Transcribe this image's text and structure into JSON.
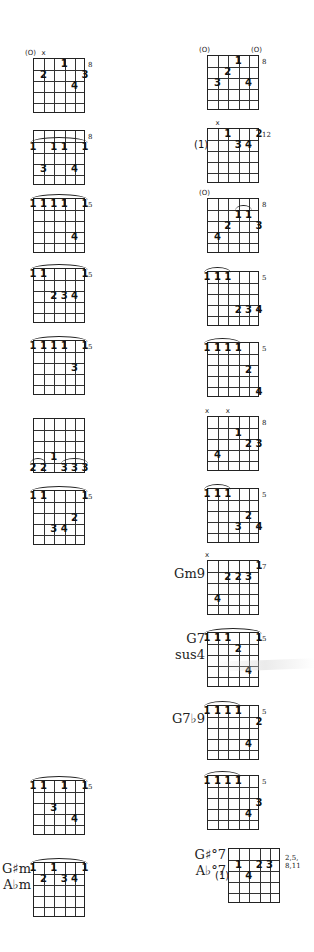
{
  "page": {
    "string_count": 6,
    "frets_shown": 5
  },
  "left_column": [
    {
      "id": "L1",
      "name": "",
      "top": 58,
      "left": 33,
      "fret": "8",
      "open_mute": [
        {
          "string": 0,
          "mark": "(O)"
        },
        {
          "string": 1,
          "mark": "x"
        }
      ],
      "fingers": [
        {
          "s": 3,
          "f": 0,
          "n": "1"
        },
        {
          "s": 1,
          "f": 1,
          "n": "2"
        },
        {
          "s": 5,
          "f": 1,
          "n": "3"
        },
        {
          "s": 4,
          "f": 2,
          "n": "4"
        }
      ],
      "barres": []
    },
    {
      "id": "L2",
      "name": "",
      "top": 130,
      "left": 33,
      "fret": "8",
      "open_mute": [],
      "fingers": [
        {
          "s": 0,
          "f": 1,
          "n": "1"
        },
        {
          "s": 2,
          "f": 1,
          "n": "1"
        },
        {
          "s": 3,
          "f": 1,
          "n": "1"
        },
        {
          "s": 5,
          "f": 1,
          "n": "1"
        },
        {
          "s": 1,
          "f": 3,
          "n": "3"
        },
        {
          "s": 4,
          "f": 3,
          "n": "4"
        }
      ],
      "barres": [
        {
          "from": 0,
          "to": 5,
          "f": 1
        }
      ]
    },
    {
      "id": "L3",
      "name": "",
      "top": 198,
      "left": 33,
      "fret": "5",
      "open_mute": [],
      "fingers": [
        {
          "s": 0,
          "f": 0,
          "n": "1"
        },
        {
          "s": 1,
          "f": 0,
          "n": "1"
        },
        {
          "s": 2,
          "f": 0,
          "n": "1"
        },
        {
          "s": 3,
          "f": 0,
          "n": "1"
        },
        {
          "s": 5,
          "f": 0,
          "n": "1"
        },
        {
          "s": 4,
          "f": 3,
          "n": "4"
        }
      ],
      "barres": [
        {
          "from": 0,
          "to": 5,
          "f": 0
        }
      ]
    },
    {
      "id": "L4",
      "name": "",
      "top": 268,
      "left": 33,
      "fret": "5",
      "open_mute": [],
      "fingers": [
        {
          "s": 0,
          "f": 0,
          "n": "1"
        },
        {
          "s": 1,
          "f": 0,
          "n": "1"
        },
        {
          "s": 5,
          "f": 0,
          "n": "1"
        },
        {
          "s": 2,
          "f": 2,
          "n": "2"
        },
        {
          "s": 3,
          "f": 2,
          "n": "3"
        },
        {
          "s": 4,
          "f": 2,
          "n": "4"
        }
      ],
      "barres": [
        {
          "from": 0,
          "to": 5,
          "f": 0
        }
      ]
    },
    {
      "id": "L5",
      "name": "",
      "top": 340,
      "left": 33,
      "fret": "5",
      "open_mute": [],
      "fingers": [
        {
          "s": 0,
          "f": 0,
          "n": "1"
        },
        {
          "s": 1,
          "f": 0,
          "n": "1"
        },
        {
          "s": 2,
          "f": 0,
          "n": "1"
        },
        {
          "s": 3,
          "f": 0,
          "n": "1"
        },
        {
          "s": 5,
          "f": 0,
          "n": "1"
        },
        {
          "s": 4,
          "f": 2,
          "n": "3"
        }
      ],
      "barres": [
        {
          "from": 0,
          "to": 5,
          "f": 0
        }
      ]
    },
    {
      "id": "L6",
      "name": "",
      "top": 418,
      "left": 33,
      "fret": "",
      "open_mute": [],
      "fingers": [
        {
          "s": 2,
          "f": 3,
          "n": "1"
        },
        {
          "s": 0,
          "f": 4,
          "n": "2"
        },
        {
          "s": 1,
          "f": 4,
          "n": "2"
        },
        {
          "s": 3,
          "f": 4,
          "n": "3"
        },
        {
          "s": 4,
          "f": 4,
          "n": "3"
        },
        {
          "s": 5,
          "f": 4,
          "n": "3"
        }
      ],
      "barres": [
        {
          "from": 0,
          "to": 1,
          "f": 4
        },
        {
          "from": 3,
          "to": 5,
          "f": 4
        }
      ]
    },
    {
      "id": "L7",
      "name": "",
      "top": 490,
      "left": 33,
      "fret": "5",
      "open_mute": [],
      "fingers": [
        {
          "s": 0,
          "f": 0,
          "n": "1"
        },
        {
          "s": 1,
          "f": 0,
          "n": "1"
        },
        {
          "s": 5,
          "f": 0,
          "n": "1"
        },
        {
          "s": 4,
          "f": 2,
          "n": "2"
        },
        {
          "s": 2,
          "f": 3,
          "n": "3"
        },
        {
          "s": 3,
          "f": 3,
          "n": "4"
        }
      ],
      "barres": [
        {
          "from": 0,
          "to": 5,
          "f": 0
        }
      ]
    },
    {
      "id": "L8",
      "name": "",
      "top": 780,
      "left": 33,
      "fret": "5",
      "open_mute": [],
      "fingers": [
        {
          "s": 0,
          "f": 0,
          "n": "1"
        },
        {
          "s": 1,
          "f": 0,
          "n": "1"
        },
        {
          "s": 3,
          "f": 0,
          "n": "1"
        },
        {
          "s": 5,
          "f": 0,
          "n": "1"
        },
        {
          "s": 2,
          "f": 2,
          "n": "3"
        },
        {
          "s": 4,
          "f": 3,
          "n": "4"
        }
      ],
      "barres": [
        {
          "from": 0,
          "to": 5,
          "f": 0
        }
      ]
    },
    {
      "id": "L9",
      "name": "G♯m\nA♭m",
      "name_line1": "G♯m",
      "name_line2": "A♭m",
      "top": 862,
      "left": 33,
      "fret": "",
      "open_mute": [],
      "fingers": [
        {
          "s": 0,
          "f": 0,
          "n": "1"
        },
        {
          "s": 2,
          "f": 0,
          "n": "1"
        },
        {
          "s": 5,
          "f": 0,
          "n": "1"
        },
        {
          "s": 1,
          "f": 1,
          "n": "2"
        },
        {
          "s": 3,
          "f": 1,
          "n": "3"
        },
        {
          "s": 4,
          "f": 1,
          "n": "4"
        }
      ],
      "barres": [
        {
          "from": 0,
          "to": 5,
          "f": 0
        }
      ]
    }
  ],
  "right_column": [
    {
      "id": "R1",
      "name": "",
      "top": 55,
      "left": 207,
      "fret": "8",
      "open_mute": [
        {
          "string": 0,
          "mark": "(O)"
        },
        {
          "string": 5,
          "mark": "(O)"
        }
      ],
      "fingers": [
        {
          "s": 3,
          "f": 0,
          "n": "1"
        },
        {
          "s": 2,
          "f": 1,
          "n": "2"
        },
        {
          "s": 1,
          "f": 2,
          "n": "3"
        },
        {
          "s": 4,
          "f": 2,
          "n": "4"
        }
      ],
      "barres": []
    },
    {
      "id": "R2",
      "name": "",
      "top": 128,
      "left": 207,
      "fret": "12",
      "open_mute": [
        {
          "string": 1,
          "mark": "x"
        }
      ],
      "fingers": [
        {
          "s": 2,
          "f": 0,
          "n": "1"
        },
        {
          "s": 5,
          "f": 0,
          "n": "2"
        },
        {
          "s": 3,
          "f": 1,
          "n": "3"
        },
        {
          "s": 4,
          "f": 1,
          "n": "4"
        }
      ],
      "barres": [],
      "extra": {
        "label": "(1)",
        "f": 1
      }
    },
    {
      "id": "R3",
      "name": "",
      "top": 198,
      "left": 207,
      "fret": "8",
      "open_mute": [
        {
          "string": 0,
          "mark": "(O)"
        }
      ],
      "fingers": [
        {
          "s": 3,
          "f": 1,
          "n": "1"
        },
        {
          "s": 4,
          "f": 1,
          "n": "1"
        },
        {
          "s": 2,
          "f": 2,
          "n": "2"
        },
        {
          "s": 5,
          "f": 2,
          "n": "3"
        },
        {
          "s": 1,
          "f": 3,
          "n": "4"
        }
      ],
      "barres": [
        {
          "from": 3,
          "to": 4,
          "f": 1
        }
      ]
    },
    {
      "id": "R4",
      "name": "",
      "top": 271,
      "left": 207,
      "fret": "5",
      "open_mute": [],
      "fingers": [
        {
          "s": 0,
          "f": 0,
          "n": "1"
        },
        {
          "s": 1,
          "f": 0,
          "n": "1"
        },
        {
          "s": 2,
          "f": 0,
          "n": "1"
        },
        {
          "s": 3,
          "f": 3,
          "n": "2"
        },
        {
          "s": 4,
          "f": 3,
          "n": "3"
        },
        {
          "s": 5,
          "f": 3,
          "n": "4"
        }
      ],
      "barres": [
        {
          "from": 0,
          "to": 2,
          "f": 0
        }
      ]
    },
    {
      "id": "R5",
      "name": "",
      "top": 342,
      "left": 207,
      "fret": "5",
      "open_mute": [],
      "fingers": [
        {
          "s": 0,
          "f": 0,
          "n": "1"
        },
        {
          "s": 1,
          "f": 0,
          "n": "1"
        },
        {
          "s": 2,
          "f": 0,
          "n": "1"
        },
        {
          "s": 3,
          "f": 0,
          "n": "1"
        },
        {
          "s": 4,
          "f": 2,
          "n": "2"
        },
        {
          "s": 5,
          "f": 4,
          "n": "4"
        }
      ],
      "barres": [
        {
          "from": 0,
          "to": 3,
          "f": 0
        }
      ]
    },
    {
      "id": "R6",
      "name": "",
      "top": 416,
      "left": 207,
      "fret": "8",
      "open_mute": [
        {
          "string": 0,
          "mark": "x"
        },
        {
          "string": 2,
          "mark": "x"
        }
      ],
      "fingers": [
        {
          "s": 3,
          "f": 1,
          "n": "1"
        },
        {
          "s": 4,
          "f": 2,
          "n": "2"
        },
        {
          "s": 5,
          "f": 2,
          "n": "3"
        },
        {
          "s": 1,
          "f": 3,
          "n": "4"
        }
      ],
      "barres": []
    },
    {
      "id": "R7",
      "name": "",
      "top": 488,
      "left": 207,
      "fret": "5",
      "open_mute": [],
      "fingers": [
        {
          "s": 0,
          "f": 0,
          "n": "1"
        },
        {
          "s": 1,
          "f": 0,
          "n": "1"
        },
        {
          "s": 2,
          "f": 0,
          "n": "1"
        },
        {
          "s": 4,
          "f": 2,
          "n": "2"
        },
        {
          "s": 3,
          "f": 3,
          "n": "3"
        },
        {
          "s": 5,
          "f": 3,
          "n": "4"
        }
      ],
      "barres": [
        {
          "from": 0,
          "to": 2,
          "f": 0
        }
      ]
    },
    {
      "id": "R8",
      "name": "Gm9",
      "top": 560,
      "left": 207,
      "fret": "7",
      "open_mute": [
        {
          "string": 0,
          "mark": "x"
        }
      ],
      "fingers": [
        {
          "s": 5,
          "f": 0,
          "n": "1"
        },
        {
          "s": 2,
          "f": 1,
          "n": "2"
        },
        {
          "s": 3,
          "f": 1,
          "n": "2"
        },
        {
          "s": 4,
          "f": 1,
          "n": "3"
        },
        {
          "s": 1,
          "f": 3,
          "n": "4"
        }
      ],
      "barres": []
    },
    {
      "id": "R9",
      "name": "G7 sus4",
      "name_line1": "G7",
      "name_line2": "sus4",
      "top": 632,
      "left": 207,
      "fret": "5",
      "open_mute": [],
      "fingers": [
        {
          "s": 0,
          "f": 0,
          "n": "1"
        },
        {
          "s": 1,
          "f": 0,
          "n": "1"
        },
        {
          "s": 2,
          "f": 0,
          "n": "1"
        },
        {
          "s": 5,
          "f": 0,
          "n": "1"
        },
        {
          "s": 3,
          "f": 1,
          "n": "2"
        },
        {
          "s": 4,
          "f": 3,
          "n": "4"
        }
      ],
      "barres": [
        {
          "from": 0,
          "to": 5,
          "f": 0
        }
      ]
    },
    {
      "id": "R10",
      "name": "G7♭9",
      "top": 705,
      "left": 207,
      "fret": "5",
      "open_mute": [],
      "fingers": [
        {
          "s": 0,
          "f": 0,
          "n": "1"
        },
        {
          "s": 1,
          "f": 0,
          "n": "1"
        },
        {
          "s": 2,
          "f": 0,
          "n": "1"
        },
        {
          "s": 3,
          "f": 0,
          "n": "1"
        },
        {
          "s": 5,
          "f": 1,
          "n": "2"
        },
        {
          "s": 4,
          "f": 3,
          "n": "4"
        }
      ],
      "barres": [
        {
          "from": 0,
          "to": 3,
          "f": 0
        }
      ]
    },
    {
      "id": "R11",
      "name": "",
      "top": 775,
      "left": 207,
      "fret": "5",
      "open_mute": [],
      "fingers": [
        {
          "s": 0,
          "f": 0,
          "n": "1"
        },
        {
          "s": 1,
          "f": 0,
          "n": "1"
        },
        {
          "s": 2,
          "f": 0,
          "n": "1"
        },
        {
          "s": 3,
          "f": 0,
          "n": "1"
        },
        {
          "s": 5,
          "f": 2,
          "n": "3"
        },
        {
          "s": 4,
          "f": 3,
          "n": "4"
        }
      ],
      "barres": [
        {
          "from": 0,
          "to": 3,
          "f": 0
        }
      ]
    },
    {
      "id": "R12",
      "name": "G♯°7 A♭°7",
      "name_line1": "G♯°7",
      "name_line2": "A♭°7",
      "top": 848,
      "left": 228,
      "fret": "2,5,\n8,11",
      "fret_line1": "2,5,",
      "fret_line2": "8,11",
      "open_mute": [],
      "fingers": [
        {
          "s": 1,
          "f": 1,
          "n": "1"
        },
        {
          "s": 3,
          "f": 1,
          "n": "2"
        },
        {
          "s": 4,
          "f": 1,
          "n": "3"
        },
        {
          "s": 2,
          "f": 2,
          "n": "4"
        }
      ],
      "barres": [],
      "extra": {
        "label": "(1)",
        "f": 2
      }
    }
  ]
}
